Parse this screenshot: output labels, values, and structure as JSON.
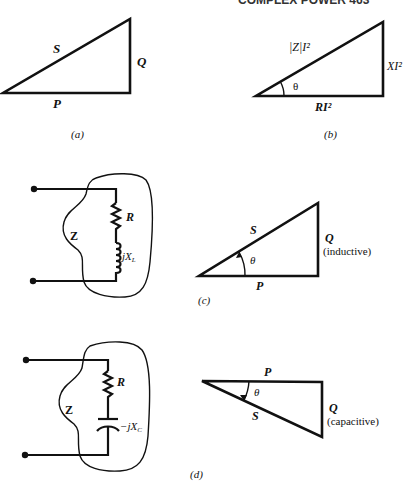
{
  "header": {
    "text": "COMPLEX POWER  463"
  },
  "panels": {
    "a": {
      "caption": "(a)",
      "hypotenuse": "S",
      "opposite": "Q",
      "adjacent": "P"
    },
    "b": {
      "caption": "(b)",
      "hypotenuse": "|Z|I²",
      "opposite": "XI²",
      "adjacent": "RI²",
      "angle": "θ"
    },
    "c": {
      "caption": "(c)",
      "circuit": {
        "impedance": "Z",
        "resistor": "R",
        "reactance": "jX",
        "reactance_sub": "L"
      },
      "triangle": {
        "hypotenuse": "S",
        "opposite": "Q",
        "opposite_note": "(inductive)",
        "adjacent": "P",
        "angle": "θ"
      }
    },
    "d": {
      "caption": "(d)",
      "circuit": {
        "impedance": "Z",
        "resistor": "R",
        "reactance": "−jX",
        "reactance_sub": "C"
      },
      "triangle": {
        "hypotenuse": "S",
        "opposite": "Q",
        "opposite_note": "(capacitive)",
        "adjacent": "P",
        "angle": "θ"
      }
    }
  }
}
